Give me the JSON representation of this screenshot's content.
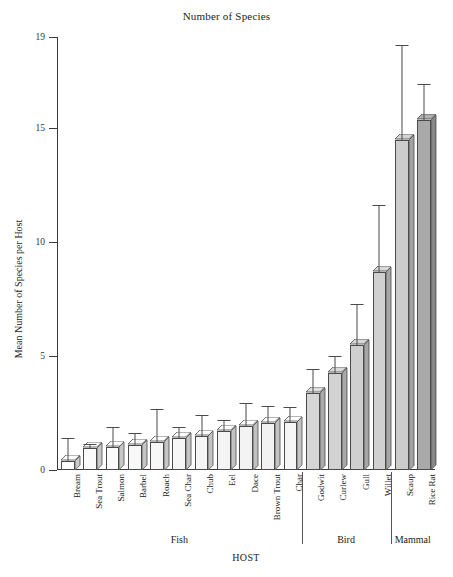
{
  "chart_data": {
    "type": "bar",
    "title": "Number of Species",
    "xlabel": "HOST",
    "ylabel": "Mean Number of Species per Host",
    "ylim": [
      0,
      19
    ],
    "yticks": [
      0,
      5,
      10,
      15,
      19
    ],
    "grid": false,
    "legend": null,
    "error_bars": "standard error",
    "categories": [
      "Bream",
      "Sea Trout",
      "Salmon",
      "Barbel",
      "Roach",
      "Sea Char",
      "Chub",
      "Eel",
      "Dace",
      "Brown Trout",
      "Char",
      "Godwit",
      "Curlew",
      "Gull",
      "Willet",
      "Scaup",
      "Rice Rat"
    ],
    "values": [
      0.4,
      0.95,
      1.0,
      1.1,
      1.25,
      1.4,
      1.5,
      1.7,
      1.95,
      2.05,
      2.1,
      3.4,
      4.25,
      5.5,
      8.7,
      14.5,
      15.35
    ],
    "error_high": [
      1.35,
      1.1,
      1.85,
      1.6,
      2.65,
      1.85,
      2.35,
      2.15,
      2.9,
      2.75,
      2.7,
      4.4,
      4.95,
      7.25,
      11.6,
      18.6,
      16.9
    ],
    "groups": [
      {
        "name": "Fish",
        "start": 0,
        "end": 10,
        "shade": "#fdfdfd"
      },
      {
        "name": "Bird",
        "start": 11,
        "end": 14,
        "shade": "#d4d4d4"
      },
      {
        "name": "Mammal",
        "start": 15,
        "end": 16,
        "shade": "#a8a8a8"
      }
    ],
    "group_shade_note": "Fish bars white/near-white, Bird bars light grey, Scaup light grey, Rice Rat dark grey",
    "bar_fills": [
      "#fefefe",
      "#fbfbfb",
      "#fafafa",
      "#f8f8f8",
      "#f7f7f7",
      "#f6f6f6",
      "#f5f5f5",
      "#f4f4f4",
      "#f3f3f3",
      "#f2f2f2",
      "#f6f6f6",
      "#d6d6d6",
      "#d2d2d2",
      "#cfcfcf",
      "#d0d0d0",
      "#cccccc",
      "#a9a9a9"
    ]
  },
  "axis": {
    "y_tick_labels": [
      "0",
      "5",
      "10",
      "15",
      "19"
    ],
    "y_title": "Mean Number of Species per Host",
    "x_title": "HOST"
  },
  "group_labels": [
    "Fish",
    "Bird",
    "Mammal"
  ],
  "colors": {
    "axis": "#3a3a3a",
    "bar_outline": "#4a4a4a",
    "error_bar": "#4a4a4a",
    "text": "#222222",
    "background": "#ffffff"
  }
}
